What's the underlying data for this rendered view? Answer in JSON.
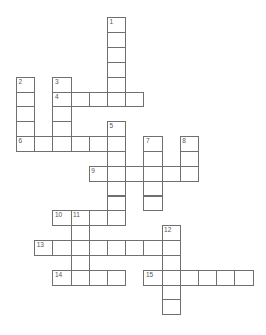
{
  "puzzle": {
    "type": "crossword",
    "layout": {
      "origin_x": 16,
      "origin_y": 17.3,
      "cell_w": 18.2,
      "cell_h": 14.85
    },
    "colors": {
      "border": "#6f6f6f",
      "number": "#555555",
      "cell": "#ffffff"
    },
    "entries": [
      {
        "number": "1",
        "direction": "down",
        "row": 0,
        "col": 5,
        "length": 6
      },
      {
        "number": "2",
        "direction": "down",
        "row": 4,
        "col": 0,
        "length": 5
      },
      {
        "number": "3",
        "direction": "down",
        "row": 4,
        "col": 2,
        "length": 5
      },
      {
        "number": "4",
        "direction": "across",
        "row": 5,
        "col": 2,
        "length": 5
      },
      {
        "number": "5",
        "direction": "down",
        "row": 7,
        "col": 5,
        "length": 7
      },
      {
        "number": "6",
        "direction": "across",
        "row": 8,
        "col": 0,
        "length": 6
      },
      {
        "number": "7",
        "direction": "down",
        "row": 8,
        "col": 7,
        "length": 5
      },
      {
        "number": "8",
        "direction": "down",
        "row": 8,
        "col": 9,
        "length": 3
      },
      {
        "number": "9",
        "direction": "across",
        "row": 10,
        "col": 4,
        "length": 6
      },
      {
        "number": "10",
        "direction": "across",
        "row": 13,
        "col": 2,
        "length": 4
      },
      {
        "number": "11",
        "direction": "down",
        "row": 13,
        "col": 3,
        "length": 5
      },
      {
        "number": "12",
        "direction": "down",
        "row": 14,
        "col": 8,
        "length": 6
      },
      {
        "number": "13",
        "direction": "across",
        "row": 15,
        "col": 1,
        "length": 8
      },
      {
        "number": "14",
        "direction": "across",
        "row": 17,
        "col": 2,
        "length": 4
      },
      {
        "number": "15",
        "direction": "across",
        "row": 17,
        "col": 7,
        "length": 6
      }
    ]
  }
}
